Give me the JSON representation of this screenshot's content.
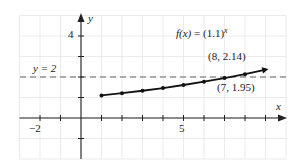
{
  "chart_data": {
    "type": "line",
    "title": "",
    "function_label": "f(x) = (1.1)^x",
    "function_label_parts": {
      "fx": "f(x)",
      "eq": " = (1.1)",
      "exp": "x"
    },
    "xlabel": "x",
    "ylabel": "y",
    "xlim": [
      -3,
      10
    ],
    "ylim": [
      -2,
      5
    ],
    "grid": true,
    "x_tick_labels": [
      {
        "value": -2,
        "label": "−2"
      },
      {
        "value": 5,
        "label": "5"
      }
    ],
    "y_tick_labels": [
      {
        "value": 4,
        "label": "4"
      }
    ],
    "x": [
      1,
      2,
      3,
      4,
      5,
      6,
      7,
      8,
      9
    ],
    "series": [
      {
        "name": "f(x) = (1.1)^x",
        "values": [
          1.1,
          1.21,
          1.33,
          1.46,
          1.61,
          1.77,
          1.95,
          2.14,
          2.36
        ]
      }
    ],
    "reference_lines": [
      {
        "type": "horizontal",
        "y": 2,
        "style": "dashed",
        "label": "y = 2"
      }
    ],
    "annotations": [
      {
        "text": "(8, 2.14)",
        "x": 8,
        "y": 2.14
      },
      {
        "text": "(7, 1.95)",
        "x": 7,
        "y": 1.95
      }
    ]
  },
  "labels": {
    "y_axis": "y",
    "x_axis": "x",
    "hline": "y = 2",
    "tick_x_neg2": "−2",
    "tick_x_5": "5",
    "tick_y_4": "4",
    "fx": "f(x)",
    "fx_eq": " = (1.1)",
    "fx_exp": "x",
    "ann_8": "(8, 2.14)",
    "ann_7": "(7, 1.95)"
  },
  "colors": {
    "axis": "#222222",
    "grid": "#e6e6e6",
    "curve": "#111111",
    "dashed": "#555555"
  }
}
